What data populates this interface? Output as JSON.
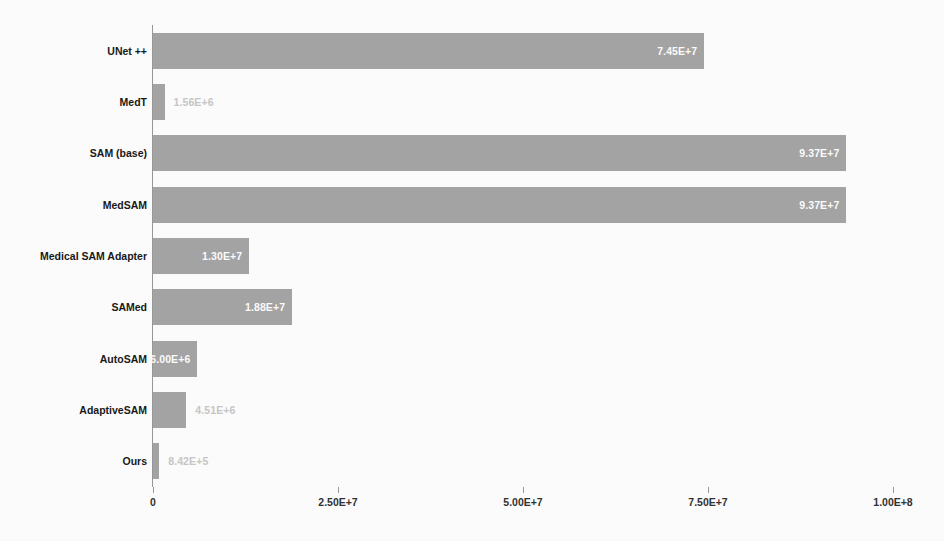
{
  "chart_data": {
    "type": "bar",
    "orientation": "horizontal",
    "title": "",
    "subtitle": "",
    "xlabel": "",
    "ylabel": "",
    "grid": false,
    "legend": null,
    "xlim": [
      0,
      100000000
    ],
    "xticks": [
      0,
      25000000,
      50000000,
      75000000,
      100000000
    ],
    "xtick_labels": [
      "0",
      "2.50E+7",
      "5.00E+7",
      "7.50E+7",
      "1.00E+8"
    ],
    "categories": [
      "UNet ++",
      "MedT",
      "SAM (base)",
      "MedSAM",
      "Medical SAM Adapter",
      "SAMed",
      "AutoSAM",
      "AdaptiveSAM",
      "Ours"
    ],
    "values": [
      74500000,
      1560000,
      93700000,
      93700000,
      13000000,
      18800000,
      6000000,
      4510000,
      842000
    ],
    "value_labels": [
      "7.45E+7",
      "1.56E+6",
      "9.37E+7",
      "9.37E+7",
      "1.30E+7",
      "1.88E+7",
      "6.00E+6",
      "4.51E+6",
      "8.42E+5"
    ],
    "label_placement": [
      "inside",
      "outside",
      "inside",
      "inside",
      "inside",
      "inside",
      "inside",
      "outside",
      "outside"
    ],
    "bar_color": "#a6a6a6",
    "inside_label_color": "#ffffff",
    "outside_label_color": "#c9c9c9",
    "axis_color": "#9a9a9a",
    "category_label_color": "#1a1a1a",
    "tick_label_color": "#333333",
    "background_color": "#ffffff"
  }
}
